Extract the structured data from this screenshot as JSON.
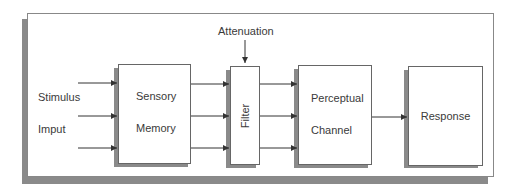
{
  "diagram": {
    "title_annotation": "Attenuation",
    "input_labels": [
      "Stimulus",
      "Imput"
    ],
    "boxes": {
      "sensory_memory": [
        "Sensory",
        "Memory"
      ],
      "filter": "Filter",
      "perceptual_channel": [
        "Perceptual",
        "Channel"
      ],
      "response": "Response"
    },
    "colors": {
      "stroke": "#333333",
      "shadow": "#8a8a8a",
      "background": "#ffffff"
    }
  }
}
